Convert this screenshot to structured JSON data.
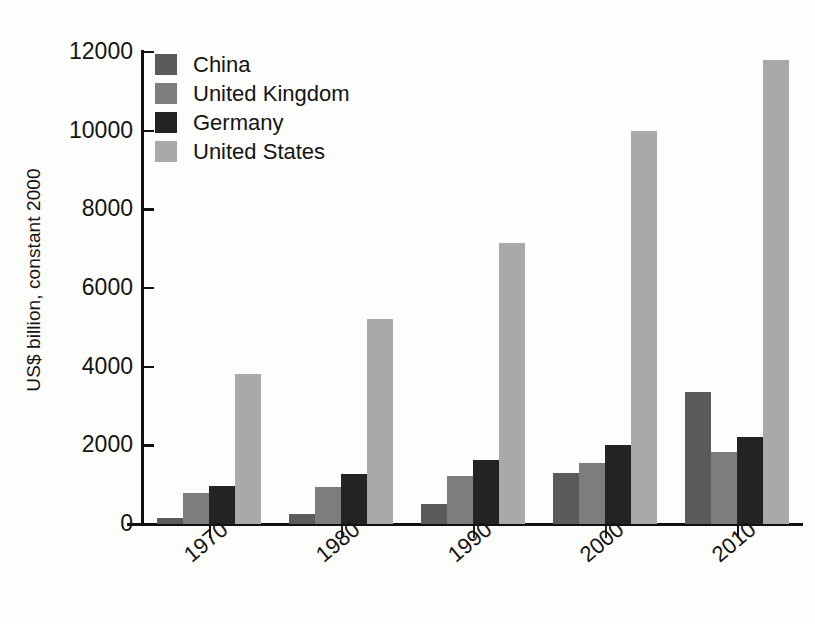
{
  "chart_data": {
    "type": "bar",
    "title": "",
    "subtitle": "",
    "xlabel": "",
    "ylabel": "US$ billion, constant 2000",
    "categories": [
      "1970",
      "1980",
      "1990",
      "2000",
      "2010"
    ],
    "ylim": [
      0,
      12000
    ],
    "y_ticks": [
      0,
      2000,
      4000,
      6000,
      8000,
      10000,
      12000
    ],
    "y_tick_labels": [
      "0",
      "2000",
      "4000",
      "6000",
      "8000",
      "10000",
      "12000"
    ],
    "grid": false,
    "legend_position": "top-left",
    "x_tick_label_rotation": -40,
    "series": [
      {
        "name": "China",
        "color": "#5b5b5b",
        "values": [
          150,
          250,
          520,
          1300,
          3350
        ]
      },
      {
        "name": "United Kingdom",
        "color": "#7d7d7d",
        "values": [
          780,
          930,
          1230,
          1550,
          1820
        ]
      },
      {
        "name": "Germany",
        "color": "#232323",
        "values": [
          960,
          1280,
          1620,
          2010,
          2200
        ]
      },
      {
        "name": "United States",
        "color": "#a9a9a9",
        "values": [
          3820,
          5200,
          7150,
          10000,
          11800
        ]
      }
    ]
  },
  "legend": {
    "items": [
      {
        "label": "China",
        "color": "#5b5b5b"
      },
      {
        "label": "United Kingdom",
        "color": "#7d7d7d"
      },
      {
        "label": "Germany",
        "color": "#232323"
      },
      {
        "label": "United States",
        "color": "#a9a9a9"
      }
    ]
  },
  "axes": {
    "y_title": "US$ billion, constant 2000",
    "axis_color": "#111111"
  }
}
